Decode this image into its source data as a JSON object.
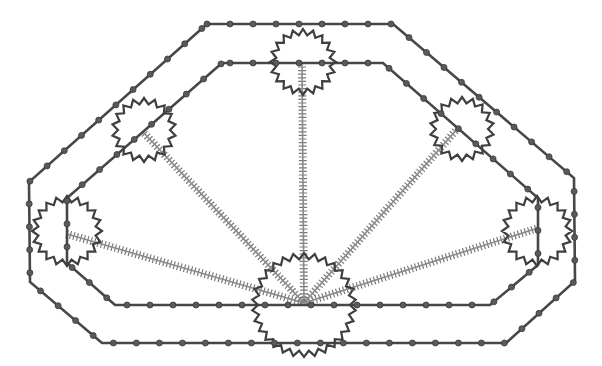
{
  "canvas": {
    "width": 602,
    "height": 366,
    "background": "#ffffff"
  },
  "colors": {
    "track": "#474747",
    "dot_fill": "#5a5a5a",
    "dot_stroke": "#3a3a3a",
    "gear": "#3f3f3f",
    "spoke_line": "#8a8a8a",
    "spoke_tick": "#7a7a7a"
  },
  "tracks": [
    {
      "id": "outer-track",
      "closed": true,
      "dot_spacing": 23,
      "dot_offset": 0,
      "points": [
        [
          207,
          24
        ],
        [
          393,
          24
        ],
        [
          574,
          178
        ],
        [
          575,
          281
        ],
        [
          506,
          343
        ],
        [
          102,
          343
        ],
        [
          30,
          282
        ],
        [
          29,
          182
        ]
      ]
    },
    {
      "id": "inner-track",
      "closed": true,
      "dot_spacing": 23,
      "dot_offset": 8,
      "points": [
        [
          222,
          63
        ],
        [
          383,
          63
        ],
        [
          538,
          198
        ],
        [
          538,
          265
        ],
        [
          490,
          305
        ],
        [
          115,
          305
        ],
        [
          67,
          263
        ],
        [
          67,
          198
        ]
      ]
    }
  ],
  "pivot": [
    304,
    303
  ],
  "spokes": [
    {
      "id": "spoke-left",
      "to": [
        67,
        234
      ]
    },
    {
      "id": "spoke-upper-left",
      "to": [
        143,
        132
      ]
    },
    {
      "id": "spoke-top",
      "to": [
        302,
        63
      ]
    },
    {
      "id": "spoke-upper-right",
      "to": [
        458,
        128
      ]
    },
    {
      "id": "spoke-right",
      "to": [
        538,
        228
      ]
    }
  ],
  "spoke_style": {
    "tick_spacing": 3.6,
    "tick_length": 8,
    "width": 1.6
  },
  "gears": [
    {
      "id": "gear-top",
      "cx": 303,
      "cy": 62,
      "r_out": 33,
      "r_in": 27,
      "teeth": 20
    },
    {
      "id": "gear-upper-left",
      "cx": 144,
      "cy": 130,
      "r_out": 32,
      "r_in": 26,
      "teeth": 18
    },
    {
      "id": "gear-upper-right",
      "cx": 462,
      "cy": 129,
      "r_out": 32,
      "r_in": 26,
      "teeth": 18
    },
    {
      "id": "gear-left",
      "cx": 67,
      "cy": 231,
      "r_out": 35,
      "r_in": 29,
      "teeth": 20
    },
    {
      "id": "gear-right",
      "cx": 537,
      "cy": 231,
      "r_out": 35,
      "r_in": 29,
      "teeth": 20
    },
    {
      "id": "gear-center",
      "cx": 304,
      "cy": 305,
      "r_out": 52,
      "r_in": 46,
      "teeth": 30
    }
  ]
}
